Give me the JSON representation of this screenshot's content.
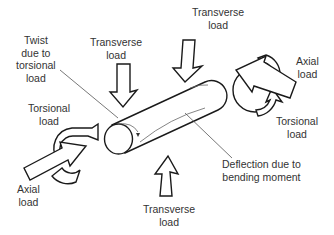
{
  "diagram": {
    "colors": {
      "stroke": "#1a1a1a",
      "text": "#333333",
      "background": "#ffffff"
    },
    "labels": {
      "transverse_top_right": [
        "Transverse",
        "load"
      ],
      "transverse_top_left": [
        "Transverse",
        "load"
      ],
      "twist": [
        "Twist",
        "due to",
        "torsional",
        "load"
      ],
      "torsional_left": [
        "Torsional",
        "load"
      ],
      "axial_right": [
        "Axial",
        "load"
      ],
      "torsional_right": [
        "Torsional",
        "load"
      ],
      "axial_left": [
        "Axial",
        "load"
      ],
      "deflection": [
        "Deflection due to",
        "bending moment"
      ],
      "transverse_bottom": [
        "Transverse",
        "load"
      ]
    },
    "elements": [
      {
        "name": "shaft",
        "icon": "cylinder"
      },
      {
        "name": "transverse-load-arrow-top-left",
        "icon": "block-arrow-down"
      },
      {
        "name": "transverse-load-arrow-top-right",
        "icon": "block-arrow-down-left"
      },
      {
        "name": "transverse-load-arrow-bottom",
        "icon": "block-arrow-up"
      },
      {
        "name": "axial-load-arrow-left",
        "icon": "block-arrow-right"
      },
      {
        "name": "axial-load-arrow-right",
        "icon": "block-arrow-left"
      },
      {
        "name": "torsional-load-arrow-left",
        "icon": "curved-arrow"
      },
      {
        "name": "torsional-load-arrow-right",
        "icon": "curved-arrow"
      }
    ]
  }
}
